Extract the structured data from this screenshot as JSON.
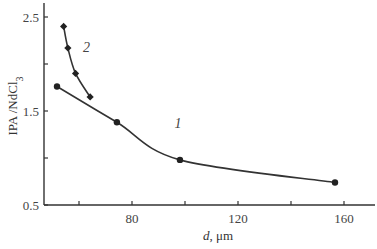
{
  "chart_data": {
    "type": "line",
    "title": "",
    "xlabel": "d, μm",
    "xlabel_italic_part": "d",
    "xlabel_rest": ", μm",
    "ylabel": "IPA /NdCl3",
    "ylabel_main": "IPA /NdCl",
    "ylabel_sub": "3",
    "xlim": [
      46.8,
      171
    ],
    "ylim": [
      0.5,
      2.7
    ],
    "x_ticks": [
      60,
      80,
      100,
      120,
      140,
      160
    ],
    "x_tick_labels": [
      "80",
      "120",
      "160"
    ],
    "x_tick_label_values": [
      80,
      120,
      160
    ],
    "y_ticks": [
      0.5,
      1.0,
      1.5,
      2.0,
      2.5
    ],
    "y_tick_labels": [
      "0.5",
      "1.5",
      "2.5"
    ],
    "y_tick_label_values": [
      0.5,
      1.5,
      2.5
    ],
    "grid": false,
    "legend": "inline curve numbers",
    "series": [
      {
        "name": "1",
        "marker": "circle",
        "x": [
          51.7,
          74.3,
          98.1,
          156.6
        ],
        "values": [
          1.76,
          1.38,
          0.98,
          0.74
        ],
        "label_pos": {
          "x": 96,
          "y": 1.32
        }
      },
      {
        "name": "2",
        "marker": "diamond",
        "x": [
          54.2,
          55.8,
          58.7,
          64.2
        ],
        "values": [
          2.4,
          2.17,
          1.9,
          1.65
        ],
        "label_pos": {
          "x": 61.5,
          "y": 2.13
        }
      }
    ],
    "colors": {
      "axis": "#333333",
      "line": "#333333",
      "marker": "#222222"
    }
  }
}
